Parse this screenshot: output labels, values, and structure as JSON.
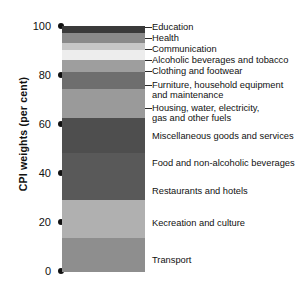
{
  "chart_data": {
    "type": "bar",
    "subtype": "stacked-vertical-single-bar",
    "title": "",
    "xlabel": "",
    "ylabel": "CPI weights (per cent)",
    "ylim": [
      0,
      100
    ],
    "yticks": [
      0,
      20,
      40,
      60,
      80,
      100
    ],
    "ytick_labels": [
      "0",
      "20",
      "40",
      "60",
      "80",
      "100"
    ],
    "grid": false,
    "legend": "none (inline labels with leader lines)",
    "categories": [
      "Transport",
      "Recreation and culture",
      "Restaurants and hotels",
      "Food and non-alcoholic beverages",
      "Miscellaneous goods and services",
      "Housing, water, electricity, gas and other fuels",
      "Furniture, household equipment and maintenance",
      "Clothing and footwear",
      "Alcoholic beverages and tobacco",
      "Communication",
      "Health",
      "Education"
    ],
    "values": [
      14,
      15,
      19,
      14,
      12,
      7,
      5,
      4,
      3,
      4,
      3,
      3
    ],
    "cumulative_top": [
      14,
      29,
      48,
      62,
      74,
      81,
      86,
      90,
      93,
      97,
      100
    ],
    "colors": [
      "#4a4a4a",
      "#8e8e8e",
      "#b0b0b0",
      "#595959",
      "#4e4e4e",
      "#9a9a9a",
      "#6e6e6e",
      "#9e9e9e",
      "#ededed",
      "#c7c7c7",
      "#8a8a8a",
      "#3a3a3a"
    ]
  },
  "segments": [
    {
      "label": "Education",
      "color": "#3a3a3a",
      "top": 0,
      "height": 7,
      "value": 3
    },
    {
      "label": "Health",
      "color": "#8a8a8a",
      "top": 7,
      "height": 10,
      "value": 3
    },
    {
      "label": "Communication",
      "color": "#c7c7c7",
      "top": 17,
      "height": 7,
      "value": 4
    },
    {
      "label": "Alcoholic beverages and tobacco",
      "color": "#ededed",
      "top": 24,
      "height": 10,
      "value": 3
    },
    {
      "label": "Clothing and footwear",
      "color": "#9e9e9e",
      "top": 34,
      "height": 12,
      "value": 4
    },
    {
      "label": "Furniture, household equipment",
      "color": "#6e6e6e",
      "top": 46,
      "height": 17,
      "value": 5
    },
    {
      "label": "Housing, water, electricity,",
      "color": "#9a9a9a",
      "top": 63,
      "height": 29,
      "value": 7
    },
    {
      "label": "Miscellaneous goods and services",
      "color": "#4e4e4e",
      "top": 92,
      "height": 35,
      "value": 12
    },
    {
      "label": "Food and non-alcoholic beverages",
      "color": "#595959",
      "top": 127,
      "height": 47,
      "value": 14
    },
    {
      "label": "Restaurants and hotels",
      "color": "#b0b0b0",
      "top": 174,
      "height": 38,
      "value": 19
    },
    {
      "label": "Kecreation and culture",
      "color": "#8e8e8e",
      "top": 212,
      "height": 34,
      "value": 15
    },
    {
      "label": "Transport",
      "color": "#4a4a4a",
      "top": 246,
      "height": 0,
      "value": 14
    }
  ],
  "callout_labels": [
    {
      "text": "Education",
      "y": 22,
      "leader": true
    },
    {
      "text": "Health",
      "y": 33,
      "leader": true
    },
    {
      "text": "Communication",
      "y": 44,
      "leader": true
    },
    {
      "text": "Alcoholic beverages and tobacco",
      "y": 55,
      "leader": true
    },
    {
      "text": "Clothing and footwear",
      "y": 66,
      "leader": true
    },
    {
      "text": "Furniture, household equipment",
      "y": 80,
      "leader": true
    },
    {
      "text": "and maintenance",
      "y": 90,
      "leader": false
    },
    {
      "text": "Housing, water, electricity,",
      "y": 103,
      "leader": true
    },
    {
      "text": "gas and other fuels",
      "y": 113,
      "leader": false
    },
    {
      "text": "Miscellaneous goods and services",
      "y": 131,
      "leader": false
    },
    {
      "text": "Food and non-alcoholic beverages",
      "y": 158,
      "leader": false
    },
    {
      "text": "Restaurants and hotels",
      "y": 186,
      "leader": false
    },
    {
      "text": "Kecreation and culture",
      "y": 218,
      "leader": false
    },
    {
      "text": "Transport",
      "y": 255,
      "leader": false
    }
  ],
  "ticks": [
    {
      "label": "100",
      "y": 26
    },
    {
      "label": "80",
      "y": 75
    },
    {
      "label": "60",
      "y": 124
    },
    {
      "label": "40",
      "y": 173
    },
    {
      "label": "20",
      "y": 222
    },
    {
      "label": "0",
      "y": 271
    }
  ],
  "axis": {
    "title": "CPI weights (per cent)"
  }
}
